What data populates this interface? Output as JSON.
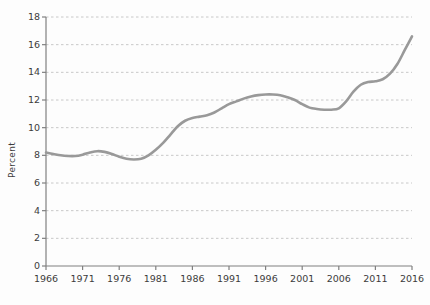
{
  "chart_data": {
    "type": "line",
    "title": "",
    "subtitle": "",
    "xlabel": "",
    "ylabel": "Percent",
    "xlim": [
      1966,
      2016
    ],
    "ylim": [
      0,
      18
    ],
    "ytick_step": 2,
    "xtick_step": 5,
    "grid": true,
    "grid_axis": "y",
    "grid_style": "dashed",
    "legend": "none",
    "line_color": "#999999",
    "grid_color": "#c8c8c8",
    "axis_color": "#808080",
    "background_color": "#fdfdfd",
    "text_color": "#3c3c3c",
    "ytick_labels": [
      "0",
      "2",
      "4",
      "6",
      "8",
      "10",
      "12",
      "14",
      "16",
      "18"
    ],
    "ytick_values": [
      0,
      2,
      4,
      6,
      8,
      10,
      12,
      14,
      16,
      18
    ],
    "xtick_labels": [
      "1966",
      "1971",
      "1976",
      "1981",
      "1986",
      "1991",
      "1996",
      "2001",
      "2006",
      "2011",
      "2016"
    ],
    "xtick_values": [
      1966,
      1971,
      1976,
      1981,
      1986,
      1991,
      1996,
      2001,
      2006,
      2011,
      2016
    ],
    "series": [
      {
        "name": "Percent",
        "x": [
          1966,
          1967,
          1968,
          1969,
          1970,
          1971,
          1972,
          1973,
          1974,
          1975,
          1976,
          1977,
          1978,
          1979,
          1980,
          1981,
          1982,
          1983,
          1984,
          1985,
          1986,
          1987,
          1988,
          1989,
          1990,
          1991,
          1992,
          1993,
          1994,
          1995,
          1996,
          1997,
          1998,
          1999,
          2000,
          2001,
          2002,
          2003,
          2004,
          2005,
          2006,
          2007,
          2008,
          2009,
          2010,
          2011,
          2012,
          2013,
          2014,
          2015,
          2016
        ],
        "values": [
          8.2,
          8.1,
          8.0,
          7.95,
          7.95,
          8.05,
          8.2,
          8.3,
          8.25,
          8.1,
          7.9,
          7.75,
          7.7,
          7.75,
          8.0,
          8.4,
          8.9,
          9.5,
          10.1,
          10.5,
          10.7,
          10.8,
          10.9,
          11.1,
          11.4,
          11.7,
          11.9,
          12.1,
          12.25,
          12.35,
          12.4,
          12.4,
          12.35,
          12.2,
          12.0,
          11.7,
          11.45,
          11.35,
          11.3,
          11.3,
          11.4,
          11.9,
          12.6,
          13.1,
          13.3,
          13.35,
          13.5,
          13.9,
          14.6,
          15.6,
          16.6
        ]
      }
    ]
  }
}
